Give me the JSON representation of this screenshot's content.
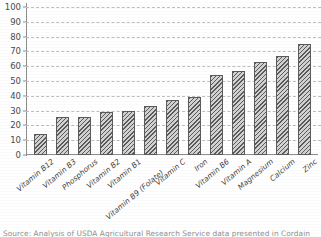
{
  "figure": {
    "title_fragment": "",
    "caption": "Source: Analysis of USDA Agricultural Research Service data presented in Cordain"
  },
  "chart_data": {
    "type": "bar",
    "title": "",
    "xlabel": "",
    "ylabel": "",
    "ylim": [
      0,
      100
    ],
    "yticks": [
      0,
      10,
      20,
      30,
      40,
      50,
      60,
      70,
      80,
      90,
      100
    ],
    "grid": true,
    "legend": "none",
    "categories": [
      "Vitamin B12",
      "Vitamin B3",
      "Phosphorus",
      "Vitamin B2",
      "Vitamin B1",
      "Vitamin B9 (Folate)",
      "Vitamin C",
      "Iron",
      "Vitamin B6",
      "Vitamin A",
      "Magnesium",
      "Calcium",
      "Zinc"
    ],
    "values": [
      14,
      26,
      26,
      29,
      30,
      33,
      37,
      39,
      54,
      57,
      63,
      67,
      75
    ]
  },
  "colors": {
    "bar_fill": "#d2d2d2",
    "bar_edge": "#5b5b5b",
    "gridline": "#bdbdbd",
    "axis": "#8d8d8d",
    "text": "#3f3f3f",
    "caption": "#8f8f8f",
    "background": "#ffffff"
  }
}
